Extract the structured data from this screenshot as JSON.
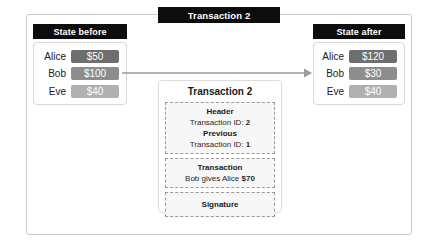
{
  "diagram": {
    "title": "Transaction 2",
    "arrow_icon": "right-arrow-icon",
    "colors": {
      "badge_bg": "#0d0d0d",
      "badge_text": "#ffffff",
      "frame_border": "#c9c9c9",
      "amount_dark": "#6e6e6e",
      "amount_medium": "#8d8d8d",
      "amount_light": "#b0b0b0",
      "arrow": "#9a9a9a",
      "dashed_border": "#9a9a9a",
      "section_bg": "#f7f7f7"
    }
  },
  "state_before": {
    "title": "State before",
    "rows": [
      {
        "name": "Alice",
        "amount": "$50",
        "shade": "#6e6e6e"
      },
      {
        "name": "Bob",
        "amount": "$100",
        "shade": "#8d8d8d"
      },
      {
        "name": "Eve",
        "amount": "$40",
        "shade": "#b0b0b0"
      }
    ]
  },
  "state_after": {
    "title": "State after",
    "rows": [
      {
        "name": "Alice",
        "amount": "$120",
        "shade": "#6e6e6e"
      },
      {
        "name": "Bob",
        "amount": "$30",
        "shade": "#8d8d8d"
      },
      {
        "name": "Eve",
        "amount": "$40",
        "shade": "#b0b0b0"
      }
    ]
  },
  "transaction_card": {
    "title": "Transaction 2",
    "header": {
      "title": "Header",
      "id_label": "Transaction ID:",
      "id_value": "2",
      "previous_title": "Previous",
      "previous_id_label": "Transaction ID:",
      "previous_id_value": "1"
    },
    "transaction": {
      "title": "Transaction",
      "body_prefix": "Bob gives Alice",
      "body_amount": "$70"
    },
    "signature": {
      "title": "Signature"
    }
  }
}
